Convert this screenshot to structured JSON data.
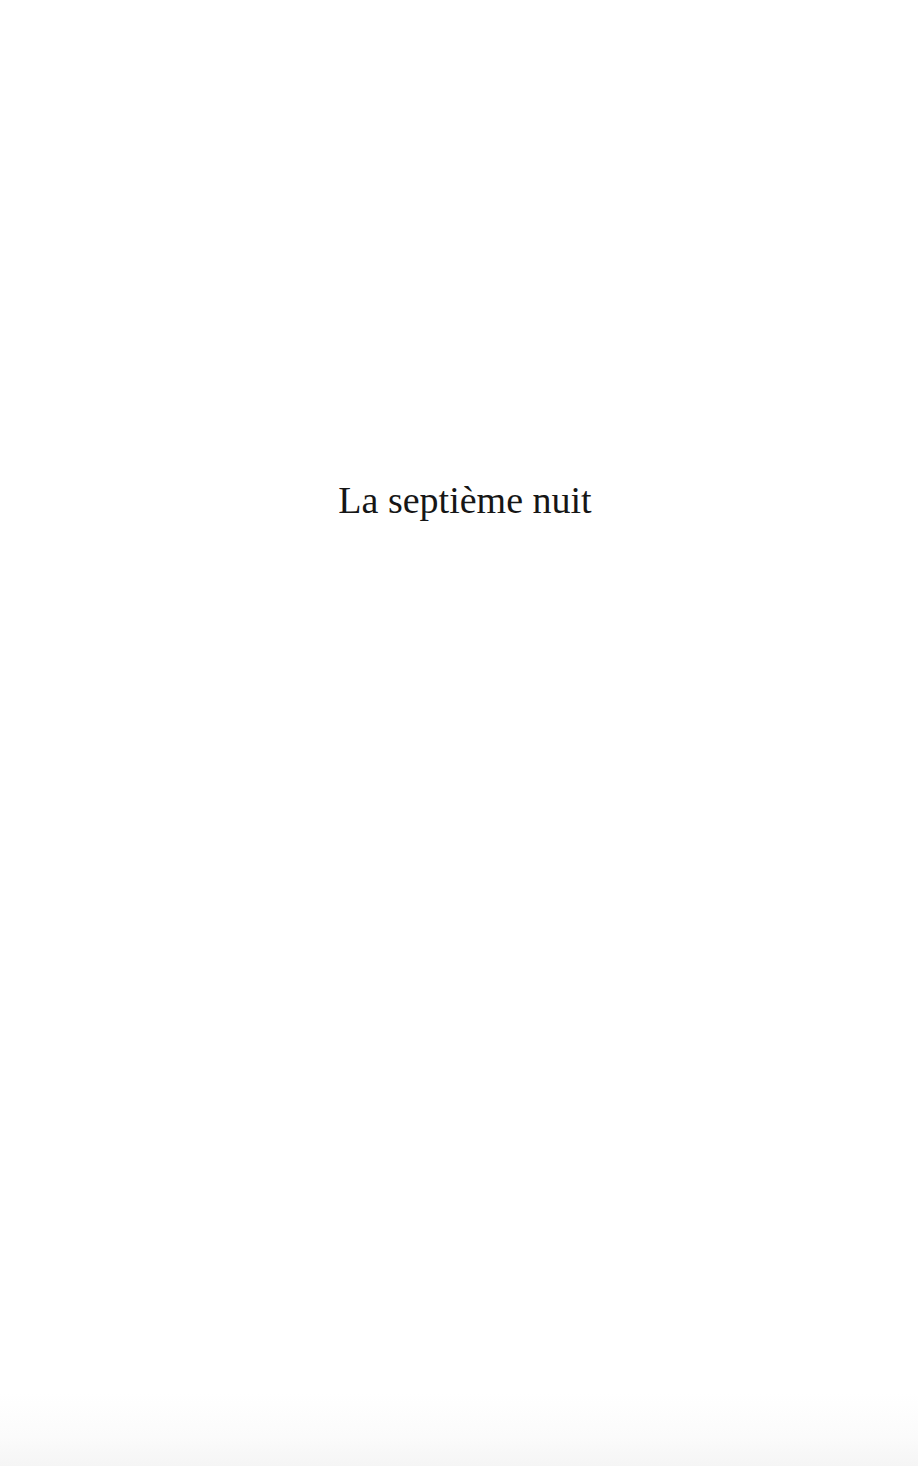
{
  "page": {
    "title": "La septième nuit"
  }
}
